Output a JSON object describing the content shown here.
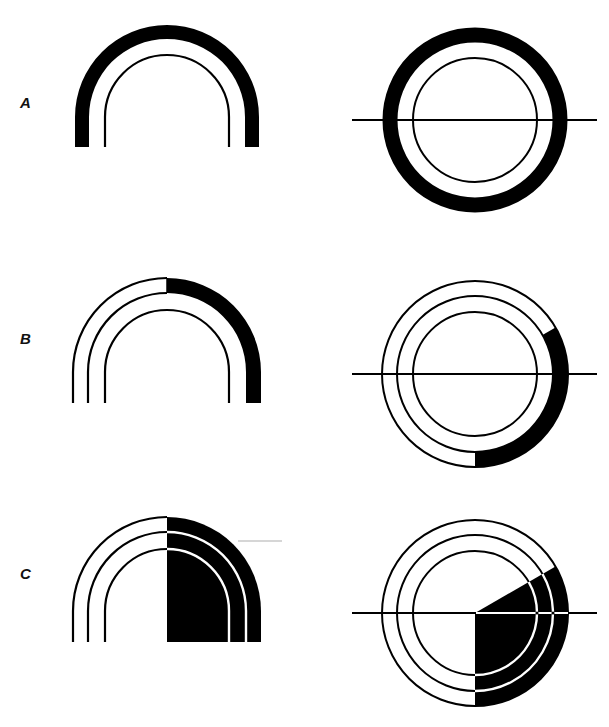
{
  "rows": [
    {
      "label": "A",
      "description": "Outer band shaded fully (arch and ring)"
    },
    {
      "label": "B",
      "description": "Outer band shaded on right half only"
    },
    {
      "label": "C",
      "description": "Right half of all bands shaded (sector)"
    }
  ],
  "colors": {
    "ink": "#000000",
    "background": "#ffffff",
    "pointer": "#c8c8c8"
  }
}
